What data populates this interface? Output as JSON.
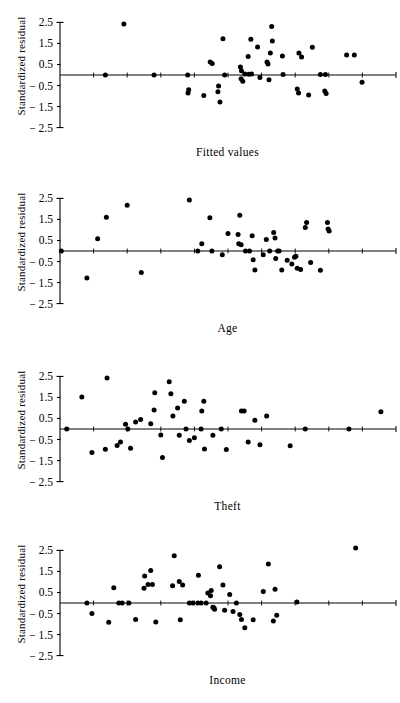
{
  "figure": {
    "title": "",
    "panel_count": 4,
    "axis_color": "#000000",
    "point_color": "#000000",
    "background": "#ffffff"
  },
  "chart_data": [
    {
      "type": "scatter",
      "title": "",
      "xlabel": "Fitted values",
      "ylabel": "Standardized residual",
      "yticks": [
        2.5,
        1.5,
        0.5,
        -0.5,
        -1.5,
        -2.5
      ],
      "ytick_labels": [
        "2.5",
        "1.5",
        "0.5",
        "− 0.5",
        "− 1.5",
        "− 2.5"
      ],
      "ylim": [
        -2.9,
        2.9
      ],
      "xlim": [
        0,
        100
      ],
      "grid": false,
      "legend": null,
      "reference_line": {
        "y": 0,
        "from_x": 0,
        "to_x": 100
      },
      "points": [
        [
          19.0,
          2.42
        ],
        [
          48.5,
          1.72
        ],
        [
          44.7,
          0.62
        ],
        [
          45.3,
          0.55
        ],
        [
          56.8,
          1.7
        ],
        [
          63.0,
          2.3
        ],
        [
          58.8,
          1.33
        ],
        [
          63.2,
          1.62
        ],
        [
          56.0,
          0.88
        ],
        [
          62.6,
          1.05
        ],
        [
          61.6,
          0.62
        ],
        [
          61.9,
          0.52
        ],
        [
          66.2,
          0.9
        ],
        [
          71.9,
          0.85
        ],
        [
          71.1,
          1.05
        ],
        [
          75.1,
          1.32
        ],
        [
          85.3,
          0.95
        ],
        [
          87.6,
          0.95
        ],
        [
          38.0,
          0.0
        ],
        [
          49.0,
          0.0
        ],
        [
          53.7,
          0.38
        ],
        [
          54.0,
          0.2
        ],
        [
          55.0,
          0.05
        ],
        [
          56.2,
          0.04
        ],
        [
          57.0,
          0.05
        ],
        [
          53.9,
          -0.18
        ],
        [
          54.4,
          -0.3
        ],
        [
          59.5,
          -0.12
        ],
        [
          62.2,
          -0.22
        ],
        [
          66.4,
          0.02
        ],
        [
          77.5,
          0.02
        ],
        [
          79.0,
          0.02
        ],
        [
          28.0,
          0.0
        ],
        [
          13.5,
          0.0
        ],
        [
          38.3,
          -0.7
        ],
        [
          38.1,
          -0.85
        ],
        [
          42.8,
          -0.98
        ],
        [
          47.2,
          -0.52
        ],
        [
          47.0,
          -0.8
        ],
        [
          47.6,
          -1.28
        ],
        [
          70.6,
          -0.66
        ],
        [
          71.0,
          -0.85
        ],
        [
          74.0,
          -0.95
        ],
        [
          78.8,
          -0.76
        ],
        [
          79.2,
          -0.88
        ],
        [
          89.9,
          -0.35
        ]
      ]
    },
    {
      "type": "scatter",
      "title": "",
      "xlabel": "Age",
      "ylabel": "Standardized residual",
      "yticks": [
        2.5,
        1.5,
        0.5,
        -0.5,
        -1.5,
        -2.5
      ],
      "ytick_labels": [
        "2.5",
        "1.5",
        "0.5",
        "− 0.5",
        "− 1.5",
        "− 2.5"
      ],
      "ylim": [
        -2.9,
        2.9
      ],
      "xlim": [
        0,
        100
      ],
      "grid": false,
      "legend": null,
      "reference_line": {
        "y": 0,
        "from_x": 0,
        "to_x": 100
      },
      "points": [
        [
          0.4,
          0.0
        ],
        [
          8.0,
          -1.28
        ],
        [
          11.2,
          0.58
        ],
        [
          13.8,
          1.6
        ],
        [
          20.0,
          2.18
        ],
        [
          24.2,
          -1.02
        ],
        [
          38.5,
          2.42
        ],
        [
          41.0,
          0.0
        ],
        [
          42.2,
          0.35
        ],
        [
          45.2,
          0.0
        ],
        [
          44.6,
          1.58
        ],
        [
          48.3,
          -0.18
        ],
        [
          50.0,
          0.83
        ],
        [
          53.0,
          0.78
        ],
        [
          53.2,
          0.35
        ],
        [
          53.9,
          0.3
        ],
        [
          53.5,
          1.7
        ],
        [
          55.2,
          0.0
        ],
        [
          56.4,
          0.0
        ],
        [
          57.2,
          0.73
        ],
        [
          57.5,
          -0.42
        ],
        [
          58.0,
          -0.9
        ],
        [
          60.5,
          -0.18
        ],
        [
          61.4,
          0.55
        ],
        [
          62.4,
          0.0
        ],
        [
          63.6,
          0.88
        ],
        [
          64.0,
          0.62
        ],
        [
          64.2,
          -0.36
        ],
        [
          64.8,
          0.0
        ],
        [
          65.2,
          0.0
        ],
        [
          66.0,
          -0.9
        ],
        [
          67.6,
          -0.44
        ],
        [
          69.0,
          -0.62
        ],
        [
          69.8,
          -0.3
        ],
        [
          70.2,
          -0.25
        ],
        [
          70.6,
          -0.82
        ],
        [
          71.6,
          -0.88
        ],
        [
          73.4,
          1.35
        ],
        [
          73.0,
          1.12
        ],
        [
          74.6,
          -0.55
        ],
        [
          77.5,
          -0.92
        ],
        [
          79.6,
          1.35
        ],
        [
          79.8,
          1.05
        ],
        [
          80.1,
          0.95
        ]
      ]
    },
    {
      "type": "scatter",
      "title": "",
      "xlabel": "Theft",
      "ylabel": "Standardized residual",
      "yticks": [
        2.5,
        1.5,
        0.5,
        -0.5,
        -1.5,
        -2.5
      ],
      "ytick_labels": [
        "2.5",
        "1.5",
        "0.5",
        "− 0.5",
        "− 1.5",
        "− 2.5"
      ],
      "ylim": [
        -2.9,
        2.9
      ],
      "xlim": [
        0,
        100
      ],
      "grid": false,
      "legend": null,
      "reference_line": {
        "y": 0,
        "from_x": 0,
        "to_x": 100
      },
      "points": [
        [
          2.0,
          0.0
        ],
        [
          6.5,
          1.52
        ],
        [
          14.0,
          2.42
        ],
        [
          9.5,
          -1.12
        ],
        [
          13.5,
          -0.96
        ],
        [
          17.0,
          -0.78
        ],
        [
          18.0,
          -0.62
        ],
        [
          19.5,
          0.22
        ],
        [
          20.2,
          0.0
        ],
        [
          21.0,
          -0.92
        ],
        [
          22.5,
          0.33
        ],
        [
          24.0,
          0.45
        ],
        [
          27.0,
          0.25
        ],
        [
          28.2,
          1.72
        ],
        [
          28.0,
          0.9
        ],
        [
          30.0,
          -0.28
        ],
        [
          30.5,
          -1.35
        ],
        [
          32.5,
          2.25
        ],
        [
          33.0,
          1.68
        ],
        [
          33.6,
          0.62
        ],
        [
          35.0,
          1.0
        ],
        [
          35.5,
          -0.3
        ],
        [
          37.0,
          1.32
        ],
        [
          37.5,
          0.0
        ],
        [
          38.5,
          -0.55
        ],
        [
          40.0,
          -0.42
        ],
        [
          42.0,
          0.0
        ],
        [
          42.2,
          0.85
        ],
        [
          42.8,
          1.32
        ],
        [
          43.0,
          -0.95
        ],
        [
          45.5,
          -0.3
        ],
        [
          48.0,
          0.0
        ],
        [
          49.5,
          -0.98
        ],
        [
          54.0,
          0.85
        ],
        [
          54.8,
          0.85
        ],
        [
          56.0,
          -0.62
        ],
        [
          58.0,
          0.42
        ],
        [
          59.5,
          -0.75
        ],
        [
          61.5,
          0.62
        ],
        [
          68.5,
          -0.8
        ],
        [
          73.0,
          0.0
        ],
        [
          86.0,
          0.0
        ],
        [
          95.5,
          0.82
        ]
      ]
    },
    {
      "type": "scatter",
      "title": "",
      "xlabel": "Income",
      "ylabel": "Standardized residual",
      "yticks": [
        2.5,
        1.5,
        0.5,
        -0.5,
        -1.5,
        -2.5
      ],
      "ytick_labels": [
        "2.5",
        "1.5",
        "0.5",
        "− 0.5",
        "− 1.5",
        "− 2.5"
      ],
      "ylim": [
        -2.9,
        2.9
      ],
      "xlim": [
        0,
        100
      ],
      "grid": false,
      "legend": null,
      "reference_line": {
        "y": 0,
        "from_x": 0,
        "to_x": 100
      },
      "points": [
        [
          8.0,
          0.0
        ],
        [
          9.5,
          -0.5
        ],
        [
          14.5,
          -0.92
        ],
        [
          16.0,
          0.72
        ],
        [
          17.5,
          0.0
        ],
        [
          18.5,
          0.0
        ],
        [
          20.5,
          0.0
        ],
        [
          22.5,
          -0.78
        ],
        [
          25.0,
          0.7
        ],
        [
          25.2,
          1.28
        ],
        [
          26.2,
          0.88
        ],
        [
          27.0,
          1.55
        ],
        [
          27.5,
          0.88
        ],
        [
          28.5,
          -0.9
        ],
        [
          34.0,
          2.25
        ],
        [
          33.5,
          0.82
        ],
        [
          35.5,
          1.02
        ],
        [
          36.5,
          0.85
        ],
        [
          35.8,
          -0.8
        ],
        [
          38.5,
          0.0
        ],
        [
          39.5,
          0.0
        ],
        [
          41.0,
          0.0
        ],
        [
          42.0,
          0.0
        ],
        [
          41.2,
          1.32
        ],
        [
          43.5,
          0.0
        ],
        [
          44.0,
          0.48
        ],
        [
          44.8,
          0.35
        ],
        [
          45.0,
          0.6
        ],
        [
          45.5,
          -0.2
        ],
        [
          46.0,
          -0.3
        ],
        [
          45.8,
          -0.22
        ],
        [
          47.5,
          1.72
        ],
        [
          48.5,
          0.85
        ],
        [
          49.0,
          -0.35
        ],
        [
          50.5,
          0.4
        ],
        [
          51.5,
          -0.4
        ],
        [
          52.5,
          0.0
        ],
        [
          53.5,
          -0.55
        ],
        [
          54.0,
          -0.78
        ],
        [
          55.0,
          -1.18
        ],
        [
          57.5,
          -0.8
        ],
        [
          60.5,
          0.55
        ],
        [
          62.0,
          1.85
        ],
        [
          64.0,
          0.65
        ],
        [
          64.5,
          -0.58
        ],
        [
          63.5,
          -0.85
        ],
        [
          70.5,
          0.05
        ],
        [
          88.0,
          2.62
        ]
      ]
    }
  ]
}
